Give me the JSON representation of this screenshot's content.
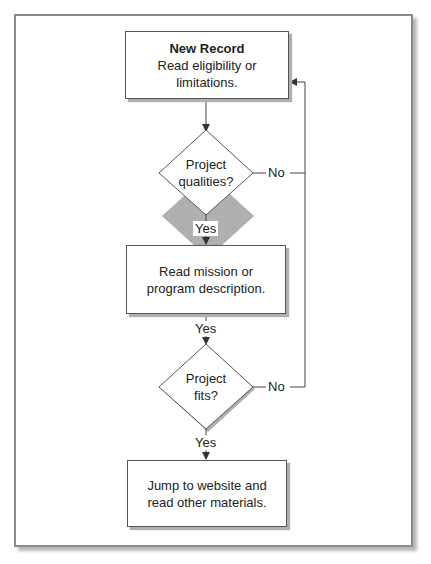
{
  "diagram": {
    "type": "flowchart",
    "nodes": {
      "start": {
        "title": "New Record",
        "text": "Read eligibility or limitations."
      },
      "decision1": {
        "line1": "Project",
        "line2": "qualities?"
      },
      "process1": {
        "line1": "Read mission or",
        "line2": "program description."
      },
      "decision2": {
        "line1": "Project",
        "line2": "fits?"
      },
      "end": {
        "line1": "Jump to website and",
        "line2": "read other materials."
      }
    },
    "edges": {
      "d1_yes": "Yes",
      "d1_no": "No",
      "p1_yes": "Yes",
      "d2_yes": "Yes",
      "d2_no": "No"
    }
  }
}
